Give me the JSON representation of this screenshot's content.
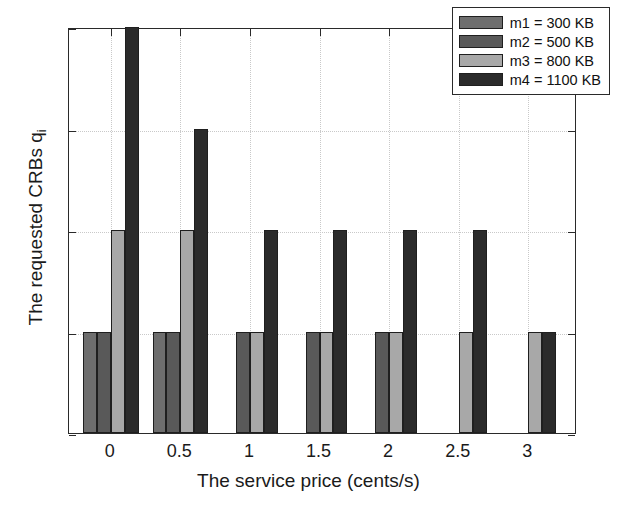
{
  "chart_data": {
    "type": "bar",
    "title": "",
    "xlabel": "The service price (cents/s)",
    "ylabel": "The requested CRBs q",
    "ylabel_subscript": "i",
    "x": [
      0,
      0.5,
      1,
      1.5,
      2,
      2.5,
      3
    ],
    "categories": [
      "0",
      "0.5",
      "1",
      "1.5",
      "2",
      "2.5",
      "3"
    ],
    "xlim": [
      -0.3,
      3.35
    ],
    "ylim": [
      0,
      4
    ],
    "xticks": [
      "0",
      "0.5",
      "1",
      "1.5",
      "2",
      "2.5",
      "3"
    ],
    "yticks": [
      "0",
      "1",
      "2",
      "3",
      "4"
    ],
    "grid": true,
    "legend_position": "top-right",
    "series": [
      {
        "name": "m1 = 300 KB",
        "color": "#6e6e6e",
        "values": [
          1,
          1,
          0,
          0,
          0,
          0,
          0
        ]
      },
      {
        "name": "m2 = 500 KB",
        "color": "#595959",
        "values": [
          1,
          1,
          1,
          1,
          1,
          0,
          0
        ]
      },
      {
        "name": "m3 = 800 KB",
        "color": "#a8a8a8",
        "values": [
          2,
          2,
          1,
          1,
          1,
          1,
          1
        ]
      },
      {
        "name": "m4 = 1100 KB",
        "color": "#2b2b2b",
        "values": [
          4,
          3,
          2,
          2,
          2,
          2,
          1
        ]
      }
    ]
  },
  "axes": {
    "edge_color": "#2a2a2a",
    "grid_color": "#c9c9c9",
    "background": "#ffffff"
  }
}
